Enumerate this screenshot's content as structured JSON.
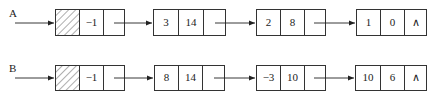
{
  "diagram": {
    "type": "linked-list",
    "lists": [
      {
        "label": "A",
        "nodes": [
          {
            "head": true,
            "coef": "−1",
            "exp": "",
            "next": ""
          },
          {
            "coef": "3",
            "exp": "14",
            "next": ""
          },
          {
            "coef": "2",
            "exp": "8",
            "next": ""
          },
          {
            "coef": "1",
            "exp": "0",
            "next": "∧"
          }
        ]
      },
      {
        "label": "B",
        "nodes": [
          {
            "head": true,
            "coef": "−1",
            "exp": "",
            "next": ""
          },
          {
            "coef": "8",
            "exp": "14",
            "next": ""
          },
          {
            "coef": "−3",
            "exp": "10",
            "next": ""
          },
          {
            "coef": "10",
            "exp": "6",
            "next": "∧"
          }
        ]
      }
    ],
    "colors": {
      "stroke": "#333333",
      "background": "#ffffff"
    }
  }
}
